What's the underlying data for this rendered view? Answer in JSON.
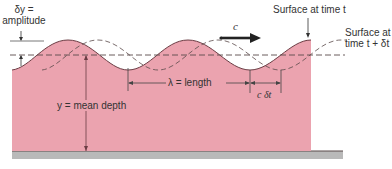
{
  "diagram": {
    "labels": {
      "amplitude_line1": "δy =",
      "amplitude_line2": "amplitude",
      "surface_t": "Surface at time t",
      "surface_t_dt_line1": "Surface at",
      "surface_t_dt_line2": "time t + δt",
      "wave_speed": "c",
      "wavelength": "λ = length",
      "displacement": "c δt",
      "mean_depth": "y = mean depth"
    },
    "colors": {
      "water_fill": "#eba3af",
      "wave_outline": "#6b3d44",
      "ground": "#b9b9b9",
      "ground_line": "#5a4a4a",
      "dashed": "#5a4a4a",
      "arrow": "#222222",
      "text": "#333333"
    }
  }
}
